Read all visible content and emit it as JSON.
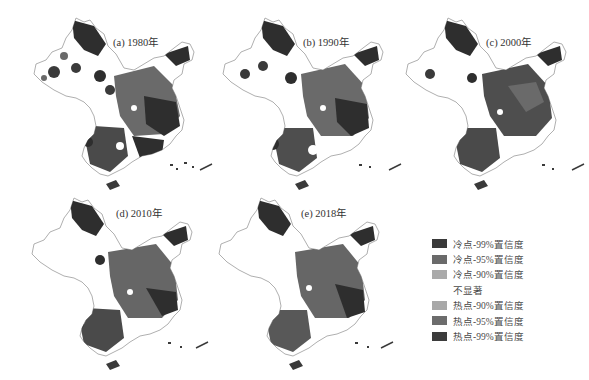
{
  "figure": {
    "panels": [
      {
        "id": "a",
        "title": "(a) 1980年",
        "year": 1980
      },
      {
        "id": "b",
        "title": "(b) 1990年",
        "year": 1990
      },
      {
        "id": "c",
        "title": "(c) 2000年",
        "year": 2000
      },
      {
        "id": "d",
        "title": "(d) 2010年",
        "year": 2010
      },
      {
        "id": "e",
        "title": "(e) 2018年",
        "year": 2018
      }
    ],
    "legend": {
      "items": [
        {
          "label": "冷点-99%置信度",
          "color": "#3a3a3a"
        },
        {
          "label": "冷点-95%置信度",
          "color": "#6a6a6a"
        },
        {
          "label": "冷点-90%置信度",
          "color": "#aaaaaa"
        },
        {
          "label": "不显著",
          "color": "#ffffff"
        },
        {
          "label": "热点-90%置信度",
          "color": "#a8a8a8"
        },
        {
          "label": "热点-95%置信度",
          "color": "#6c6c6c"
        },
        {
          "label": "热点-99%置信度",
          "color": "#3c3c3c"
        }
      ]
    }
  },
  "colors": {
    "outline": "#9a9a9a",
    "dark": "#2e2e2e",
    "mid": "#6a6a6a",
    "light": "#b0b0b0"
  }
}
